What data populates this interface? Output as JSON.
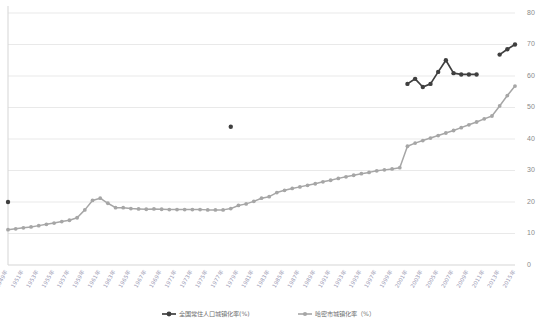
{
  "chart_data": {
    "type": "line",
    "title": "",
    "xlabel": "",
    "ylabel": "",
    "ylim": [
      0,
      80
    ],
    "ytick_values": [
      0,
      10,
      20,
      30,
      40,
      50,
      60,
      70,
      80
    ],
    "ytick_labels": [
      "0",
      "10",
      "20",
      "30",
      "40",
      "50",
      "60",
      "70",
      "80"
    ],
    "yaxis_position": "right",
    "grid": true,
    "legend_position": "bottom",
    "categories": [
      "1949年",
      "1950年",
      "1951年",
      "1952年",
      "1953年",
      "1954年",
      "1955年",
      "1956年",
      "1957年",
      "1958年",
      "1959年",
      "1960年",
      "1961年",
      "1962年",
      "1963年",
      "1964年",
      "1965年",
      "1966年",
      "1967年",
      "1968年",
      "1969年",
      "1970年",
      "1971年",
      "1972年",
      "1973年",
      "1974年",
      "1975年",
      "1976年",
      "1977年",
      "1978年",
      "1979年",
      "1980年",
      "1981年",
      "1982年",
      "1983年",
      "1984年",
      "1985年",
      "1986年",
      "1987年",
      "1988年",
      "1989年",
      "1990年",
      "1991年",
      "1992年",
      "1993年",
      "1994年",
      "1995年",
      "1996年",
      "1997年",
      "1998年",
      "1999年",
      "2000年",
      "2001年",
      "2002年",
      "2003年",
      "2004年",
      "2005年",
      "2006年",
      "2007年",
      "2008年",
      "2009年",
      "2010年",
      "2011年",
      "2012年",
      "2013年",
      "2014年",
      "2015年"
    ],
    "xtick_labels": [
      "1949年",
      "1951年",
      "1953年",
      "1955年",
      "1957年",
      "1959年",
      "1961年",
      "1963年",
      "1965年",
      "1967年",
      "1969年",
      "1971年",
      "1973年",
      "1975年",
      "1977年",
      "1979年",
      "1981年",
      "1983年",
      "1985年",
      "1987年",
      "1989年",
      "1991年",
      "1993年",
      "1995年",
      "1997年",
      "1999年",
      "2001年",
      "2003年",
      "2005年",
      "2007年",
      "2009年",
      "2011年",
      "2013年",
      "2015年"
    ],
    "series": [
      {
        "name": "全国常住人口城镇化率(%)",
        "color": "#3f3f3f",
        "values": [
          20.0,
          null,
          null,
          null,
          null,
          null,
          null,
          null,
          null,
          null,
          null,
          null,
          null,
          null,
          null,
          null,
          null,
          null,
          null,
          null,
          null,
          null,
          null,
          null,
          null,
          null,
          null,
          null,
          null,
          43.9,
          null,
          null,
          null,
          null,
          null,
          null,
          null,
          null,
          null,
          null,
          null,
          null,
          null,
          null,
          null,
          null,
          null,
          null,
          null,
          null,
          null,
          null,
          57.5,
          59.1,
          56.5,
          57.5,
          61.3,
          65.0,
          60.9,
          60.5,
          60.5,
          60.5,
          null,
          null,
          66.8,
          68.5,
          70.0
        ]
      },
      {
        "name": "哈密市城镇化率（%）",
        "color": "#a6a6a6",
        "values": [
          11.2,
          11.5,
          11.8,
          12.1,
          12.5,
          12.9,
          13.3,
          13.8,
          14.2,
          15.0,
          17.5,
          20.5,
          21.2,
          19.6,
          18.2,
          18.2,
          17.9,
          17.8,
          17.7,
          17.8,
          17.7,
          17.6,
          17.6,
          17.6,
          17.6,
          17.6,
          17.5,
          17.5,
          17.5,
          17.9,
          18.9,
          19.4,
          20.2,
          21.2,
          21.7,
          23.0,
          23.7,
          24.3,
          24.8,
          25.3,
          25.8,
          26.4,
          26.9,
          27.5,
          28.0,
          28.5,
          29.0,
          29.4,
          29.9,
          30.2,
          30.5,
          30.9,
          37.7,
          38.7,
          39.5,
          40.3,
          41.1,
          41.9,
          42.7,
          43.6,
          44.5,
          45.4,
          46.4,
          47.3,
          50.5,
          53.8,
          56.8
        ]
      }
    ],
    "legend": [
      {
        "label": "全国常住人口城镇化率(%)",
        "color": "#3f3f3f",
        "marker": "circle"
      },
      {
        "label": "哈密市城镇化率（%）",
        "color": "#a6a6a6",
        "marker": "circle"
      }
    ]
  }
}
